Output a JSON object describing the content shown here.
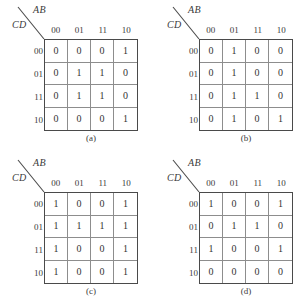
{
  "figure": {
    "row_var_label": "CD",
    "col_var_label": "AB",
    "col_headers": [
      "00",
      "01",
      "11",
      "10"
    ],
    "row_headers": [
      "00",
      "01",
      "11",
      "10"
    ],
    "line_color": "#4a4a4a",
    "grid_color": "#8d8d8d",
    "text_color": "#333333"
  },
  "maps": [
    {
      "caption": "(a)",
      "col_var_label": "AB",
      "row_var_label": "CD",
      "col_headers": [
        "00",
        "01",
        "11",
        "10"
      ],
      "row_headers": [
        "00",
        "01",
        "11",
        "10"
      ],
      "rows": [
        [
          "0",
          "0",
          "0",
          "1"
        ],
        [
          "0",
          "1",
          "1",
          "0"
        ],
        [
          "0",
          "1",
          "1",
          "0"
        ],
        [
          "0",
          "0",
          "0",
          "1"
        ]
      ]
    },
    {
      "caption": "(b)",
      "col_var_label": "AB",
      "row_var_label": "CD",
      "col_headers": [
        "00",
        "01",
        "11",
        "10"
      ],
      "row_headers": [
        "00",
        "01",
        "11",
        "10"
      ],
      "rows": [
        [
          "0",
          "1",
          "0",
          "0"
        ],
        [
          "0",
          "1",
          "0",
          "0"
        ],
        [
          "0",
          "1",
          "1",
          "0"
        ],
        [
          "0",
          "1",
          "0",
          "1"
        ]
      ]
    },
    {
      "caption": "(c)",
      "col_var_label": "AB",
      "row_var_label": "CD",
      "col_headers": [
        "00",
        "01",
        "11",
        "10"
      ],
      "row_headers": [
        "00",
        "01",
        "11",
        "10"
      ],
      "rows": [
        [
          "1",
          "0",
          "0",
          "1"
        ],
        [
          "1",
          "1",
          "1",
          "1"
        ],
        [
          "1",
          "0",
          "0",
          "1"
        ],
        [
          "1",
          "0",
          "0",
          "1"
        ]
      ]
    },
    {
      "caption": "(d)",
      "col_var_label": "AB",
      "row_var_label": "CD",
      "col_headers": [
        "00",
        "01",
        "11",
        "10"
      ],
      "row_headers": [
        "00",
        "01",
        "11",
        "10"
      ],
      "rows": [
        [
          "1",
          "0",
          "0",
          "1"
        ],
        [
          "0",
          "1",
          "1",
          "0"
        ],
        [
          "1",
          "0",
          "0",
          "1"
        ],
        [
          "0",
          "0",
          "0",
          "0"
        ]
      ]
    }
  ]
}
